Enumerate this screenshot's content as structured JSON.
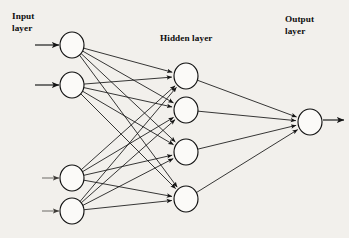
{
  "figure": {
    "background_color": "#f2f0ec",
    "stroke_color": "#141414",
    "node_fill_color": "#fbfaf8",
    "width": 349,
    "height": 238
  },
  "labels": {
    "input": "Input\nlayer",
    "hidden": "Hidden layer",
    "output": "Output\nlayer"
  },
  "chart_data": {
    "type": "diagram",
    "diagram_kind": "neural-network",
    "layers": [
      {
        "name": "Input layer",
        "label": "Input\nlayer",
        "node_count": 4,
        "x": 72,
        "nodes": [
          {
            "id": "i1",
            "cx": 72,
            "cy": 45
          },
          {
            "id": "i2",
            "cx": 72,
            "cy": 85
          },
          {
            "id": "i3",
            "cx": 72,
            "cy": 178
          },
          {
            "id": "i4",
            "cx": 72,
            "cy": 211
          }
        ]
      },
      {
        "name": "Hidden layer",
        "label": "Hidden layer",
        "node_count": 4,
        "x": 186,
        "nodes": [
          {
            "id": "h1",
            "cx": 186,
            "cy": 76
          },
          {
            "id": "h2",
            "cx": 186,
            "cy": 110
          },
          {
            "id": "h3",
            "cx": 186,
            "cy": 152
          },
          {
            "id": "h4",
            "cx": 186,
            "cy": 199
          }
        ]
      },
      {
        "name": "Output layer",
        "label": "Output\nlayer",
        "node_count": 1,
        "x": 310,
        "nodes": [
          {
            "id": "o1",
            "cx": 310,
            "cy": 122
          }
        ]
      }
    ],
    "node_shape": {
      "rx": 12,
      "ry": 13
    },
    "connections": {
      "input_to_hidden": "fully-connected",
      "hidden_to_output": "fully-connected",
      "total_edges": 20,
      "arrowheads": true
    },
    "external_arrows": {
      "inputs": [
        {
          "target": "i1",
          "x1": 35,
          "y1": 45,
          "x2": 59,
          "y2": 45
        },
        {
          "target": "i2",
          "x1": 35,
          "y1": 85,
          "x2": 59,
          "y2": 85
        },
        {
          "target": "i3",
          "x1": 42,
          "y1": 178,
          "x2": 59,
          "y2": 178
        },
        {
          "target": "i4",
          "x1": 42,
          "y1": 211,
          "x2": 59,
          "y2": 211
        }
      ],
      "outputs": [
        {
          "source": "o1",
          "x1": 323,
          "y1": 120,
          "x2": 344,
          "y2": 120
        }
      ]
    }
  }
}
